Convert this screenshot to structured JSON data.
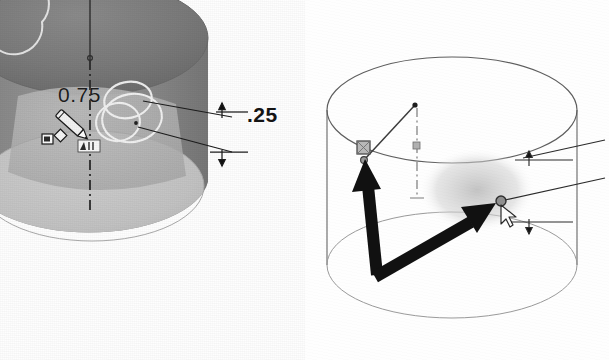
{
  "figure": {
    "type": "cad-screenshot-pair",
    "background_color": "#ffffff"
  },
  "colors": {
    "shaded_body": "#8d8d8d",
    "shaded_top": "#6f6f6f",
    "shaded_recess": "#b4b4b4",
    "shaded_bottom": "#c2c2c2",
    "highlight_circle": "#f2f2f2",
    "wireframe_line": "#5a5a5a",
    "arrow_black": "#111111",
    "centerline": "#3a3a3a",
    "selection_marker": "#7c7c7c",
    "dim_text": "#141414"
  },
  "left_view": {
    "name": "shaded-cylinder-view",
    "description": "Shaded grey cylinder, isometric, with circular boss feature selected",
    "dimensions": [
      {
        "id": "diameter-075",
        "label": "0.75",
        "kind": "diameter",
        "position": "upper-left of boss"
      },
      {
        "id": "height-025",
        "label": ".25",
        "kind": "linear-height",
        "position": "right side, between two leader arrows"
      }
    ],
    "cursor": {
      "name": "sketch-pencil-cursor",
      "label": "pencil"
    },
    "badge": {
      "name": "dimension-value-badge",
      "label": ".01"
    },
    "centerline": {
      "name": "vertical-centerline",
      "style": "dash-dot"
    },
    "highlight_circles": 3
  },
  "right_view": {
    "name": "wireframe-cylinder-view",
    "description": "Wireframe cylinder with two bold black selection arrows and a floating context toolbar",
    "dimensions": [
      {
        "id": "height-025",
        "label": ".25",
        "kind": "linear-height",
        "position": "far right, between two leader arrows"
      }
    ],
    "arrows": [
      {
        "name": "arrow-to-vertex-point",
        "direction": "up-left",
        "target": "square-vertex-marker"
      },
      {
        "name": "arrow-to-selected-point",
        "direction": "up-right",
        "target": "circular-point-marker"
      }
    ],
    "markers": [
      {
        "name": "square-vertex-marker",
        "shape": "square"
      },
      {
        "name": "circular-point-marker",
        "shape": "circle"
      }
    ],
    "cursor": {
      "name": "select-arrow-cursor",
      "label": "pointer"
    },
    "radius_line": {
      "name": "radius-construction-line",
      "from": "top-face-center",
      "to": "rim-point"
    },
    "centerline": {
      "name": "vertical-centerline",
      "style": "dash-dot"
    },
    "context_toolbar": {
      "name": "context-toolbar",
      "rows": 2,
      "cols": 3,
      "items": [
        {
          "name": "smart-dimension-icon",
          "label": "Smart Dimension"
        },
        {
          "name": "vertical-relation-icon",
          "label": "Vertical"
        },
        {
          "name": "construction-geometry-icon",
          "label": "Construction Geometry"
        },
        {
          "name": "extrude-boss-icon",
          "label": "Extruded Boss"
        },
        {
          "name": "zoom-to-area-icon",
          "label": "Zoom to Area"
        },
        {
          "name": "normal-to-icon",
          "label": "Normal To"
        }
      ]
    }
  }
}
